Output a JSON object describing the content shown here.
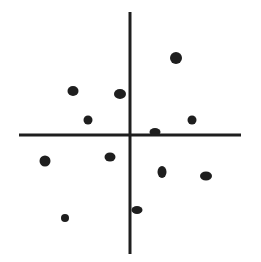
{
  "diagram": {
    "background": "#ffffff",
    "ink_color": "#1e1e1e",
    "axes": {
      "horizontal": {
        "x1": 19,
        "x2": 241,
        "y": 135,
        "stroke_width": 3
      },
      "vertical": {
        "x": 130,
        "y1": 12,
        "y2": 254,
        "stroke_width": 3
      }
    },
    "points": [
      {
        "cx": 176,
        "cy": 58,
        "rx": 6,
        "ry": 6
      },
      {
        "cx": 73,
        "cy": 91,
        "rx": 5.5,
        "ry": 5
      },
      {
        "cx": 120,
        "cy": 94,
        "rx": 6,
        "ry": 5
      },
      {
        "cx": 88,
        "cy": 120,
        "rx": 4.5,
        "ry": 4.5
      },
      {
        "cx": 192,
        "cy": 120,
        "rx": 4.5,
        "ry": 4.5
      },
      {
        "cx": 155,
        "cy": 132,
        "rx": 5.5,
        "ry": 4
      },
      {
        "cx": 45,
        "cy": 161,
        "rx": 5.5,
        "ry": 5.5
      },
      {
        "cx": 110,
        "cy": 157,
        "rx": 5.5,
        "ry": 4.5
      },
      {
        "cx": 162,
        "cy": 172,
        "rx": 4.5,
        "ry": 6
      },
      {
        "cx": 206,
        "cy": 176,
        "rx": 6,
        "ry": 4.5
      },
      {
        "cx": 65,
        "cy": 218,
        "rx": 4,
        "ry": 4
      },
      {
        "cx": 137,
        "cy": 210,
        "rx": 5.5,
        "ry": 4
      }
    ]
  }
}
